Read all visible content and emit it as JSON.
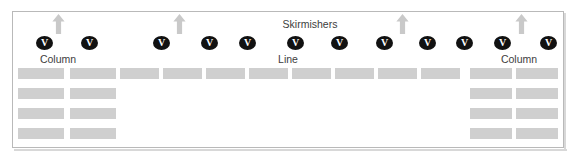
{
  "diagram": {
    "title_labels": [
      {
        "id": "skirmishers",
        "text": "Skirmishers",
        "x": 310,
        "y": 19
      },
      {
        "id": "column-left",
        "text": "Column",
        "x": 58,
        "y": 54
      },
      {
        "id": "line-center",
        "text": "Line",
        "x": 288,
        "y": 54
      },
      {
        "id": "column-right",
        "text": "Column",
        "x": 519,
        "y": 54
      }
    ],
    "unit_markers": [
      {
        "id": "unit-1",
        "glyph": "V",
        "x": 36,
        "y": 36
      },
      {
        "id": "unit-2",
        "glyph": "V",
        "x": 81,
        "y": 36
      },
      {
        "id": "unit-3",
        "glyph": "V",
        "x": 153,
        "y": 36
      },
      {
        "id": "unit-4",
        "glyph": "V",
        "x": 201,
        "y": 36
      },
      {
        "id": "unit-5",
        "glyph": "V",
        "x": 239,
        "y": 36
      },
      {
        "id": "unit-6",
        "glyph": "V",
        "x": 287,
        "y": 36
      },
      {
        "id": "unit-7",
        "glyph": "V",
        "x": 331,
        "y": 36
      },
      {
        "id": "unit-8",
        "glyph": "V",
        "x": 376,
        "y": 36
      },
      {
        "id": "unit-9",
        "glyph": "V",
        "x": 419,
        "y": 36
      },
      {
        "id": "unit-10",
        "glyph": "V",
        "x": 456,
        "y": 36
      },
      {
        "id": "unit-11",
        "glyph": "V",
        "x": 494,
        "y": 36
      },
      {
        "id": "unit-12",
        "glyph": "V",
        "x": 540,
        "y": 36
      }
    ],
    "direction_arrows": [
      {
        "id": "arrow-1",
        "direction": "up",
        "x": 52,
        "y": 14
      },
      {
        "id": "arrow-2",
        "direction": "up",
        "x": 173,
        "y": 14
      },
      {
        "id": "arrow-3",
        "direction": "up",
        "x": 396,
        "y": 14
      },
      {
        "id": "arrow-4",
        "direction": "up",
        "x": 515,
        "y": 14
      }
    ],
    "formation_blocks": [
      {
        "id": "block-col-left-r1-c1",
        "group": "column-left",
        "x": 18,
        "y": 68,
        "w": 46,
        "h": 11
      },
      {
        "id": "block-col-left-r1-c2",
        "group": "column-left",
        "x": 70,
        "y": 68,
        "w": 46,
        "h": 11
      },
      {
        "id": "block-col-left-r2-c1",
        "group": "column-left",
        "x": 18,
        "y": 88,
        "w": 46,
        "h": 11
      },
      {
        "id": "block-col-left-r2-c2",
        "group": "column-left",
        "x": 70,
        "y": 88,
        "w": 46,
        "h": 11
      },
      {
        "id": "block-col-left-r3-c1",
        "group": "column-left",
        "x": 18,
        "y": 108,
        "w": 46,
        "h": 11
      },
      {
        "id": "block-col-left-r3-c2",
        "group": "column-left",
        "x": 70,
        "y": 108,
        "w": 46,
        "h": 11
      },
      {
        "id": "block-col-left-r4-c1",
        "group": "column-left",
        "x": 18,
        "y": 128,
        "w": 46,
        "h": 11
      },
      {
        "id": "block-col-left-r4-c2",
        "group": "column-left",
        "x": 70,
        "y": 128,
        "w": 46,
        "h": 11
      },
      {
        "id": "block-line-1",
        "group": "line",
        "x": 120,
        "y": 68,
        "w": 39,
        "h": 11
      },
      {
        "id": "block-line-2",
        "group": "line",
        "x": 163,
        "y": 68,
        "w": 39,
        "h": 11
      },
      {
        "id": "block-line-3",
        "group": "line",
        "x": 206,
        "y": 68,
        "w": 39,
        "h": 11
      },
      {
        "id": "block-line-4",
        "group": "line",
        "x": 249,
        "y": 68,
        "w": 39,
        "h": 11
      },
      {
        "id": "block-line-5",
        "group": "line",
        "x": 292,
        "y": 68,
        "w": 39,
        "h": 11
      },
      {
        "id": "block-line-6",
        "group": "line",
        "x": 335,
        "y": 68,
        "w": 39,
        "h": 11
      },
      {
        "id": "block-line-7",
        "group": "line",
        "x": 378,
        "y": 68,
        "w": 39,
        "h": 11
      },
      {
        "id": "block-line-8",
        "group": "line",
        "x": 421,
        "y": 68,
        "w": 39,
        "h": 11
      },
      {
        "id": "block-col-right-r1-c1",
        "group": "column-right",
        "x": 470,
        "y": 68,
        "w": 42,
        "h": 11
      },
      {
        "id": "block-col-right-r1-c2",
        "group": "column-right",
        "x": 516,
        "y": 68,
        "w": 42,
        "h": 11
      },
      {
        "id": "block-col-right-r2-c1",
        "group": "column-right",
        "x": 470,
        "y": 88,
        "w": 42,
        "h": 11
      },
      {
        "id": "block-col-right-r2-c2",
        "group": "column-right",
        "x": 516,
        "y": 88,
        "w": 42,
        "h": 11
      },
      {
        "id": "block-col-right-r3-c1",
        "group": "column-right",
        "x": 470,
        "y": 108,
        "w": 42,
        "h": 11
      },
      {
        "id": "block-col-right-r3-c2",
        "group": "column-right",
        "x": 516,
        "y": 108,
        "w": 42,
        "h": 11
      },
      {
        "id": "block-col-right-r4-c1",
        "group": "column-right",
        "x": 470,
        "y": 128,
        "w": 42,
        "h": 11
      },
      {
        "id": "block-col-right-r4-c2",
        "group": "column-right",
        "x": 516,
        "y": 128,
        "w": 42,
        "h": 11
      }
    ],
    "colors": {
      "block_fill": "#cfcfcf",
      "marker_fill": "#111111",
      "marker_glyph": "#ffffff",
      "arrow_fill": "#c9c9c9",
      "label_text": "#3d3d3d",
      "frame_border": "#b9b9b9",
      "background": "#ffffff"
    }
  }
}
